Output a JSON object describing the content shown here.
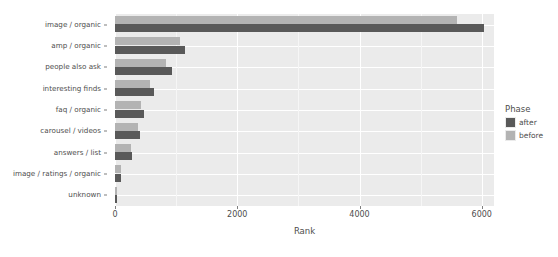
{
  "chart_data": {
    "type": "bar",
    "orientation": "horizontal",
    "title": "",
    "xlabel": "Rank",
    "ylabel": "",
    "xlim": [
      0,
      6200
    ],
    "xticks": [
      0,
      2000,
      4000,
      6000
    ],
    "xtick_labels": [
      "0",
      "2000",
      "4000",
      "6000"
    ],
    "grid": true,
    "legend": {
      "title": "Phase",
      "position": "right",
      "entries": [
        {
          "name": "after",
          "color": "#595959"
        },
        {
          "name": "before",
          "color": "#b3b3b3"
        }
      ]
    },
    "categories": [
      "image / organic",
      "amp / organic",
      "people also ask",
      "interesting finds",
      "faq / organic",
      "carousel / videos",
      "answers / list",
      "image / ratings / organic",
      "unknown"
    ],
    "series": [
      {
        "name": "before",
        "color": "#b3b3b3",
        "values": [
          5600,
          1060,
          840,
          580,
          430,
          380,
          265,
          100,
          25
        ]
      },
      {
        "name": "after",
        "color": "#595959",
        "values": [
          6030,
          1140,
          930,
          640,
          480,
          410,
          280,
          95,
          30
        ]
      }
    ]
  },
  "panel": {
    "background": "#ebebeb",
    "gridline_color": "#ffffff"
  }
}
